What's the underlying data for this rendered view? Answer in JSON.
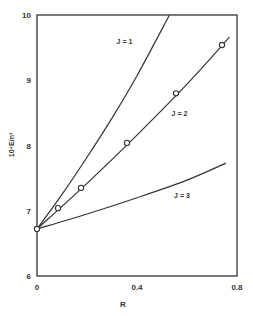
{
  "chart_data": {
    "type": "line",
    "title": "",
    "xlabel": "R",
    "ylabel": "10⁴E/n³",
    "xlim": [
      0,
      0.8
    ],
    "ylim": [
      6,
      10
    ],
    "xticks": [
      0,
      0.4,
      0.8
    ],
    "xtick_labels": [
      "0",
      "0.4",
      "0.8"
    ],
    "yticks": [
      6,
      7,
      8,
      9,
      10
    ],
    "ytick_labels": [
      "6",
      "7",
      "8",
      "9",
      "10"
    ],
    "grid": false,
    "legend": "inline labels",
    "series": [
      {
        "name": "J = 1",
        "style": "line",
        "x": [
          0,
          0.1,
          0.2,
          0.3,
          0.4,
          0.53
        ],
        "y": [
          6.72,
          7.25,
          7.82,
          8.42,
          9.07,
          10.0
        ]
      },
      {
        "name": "J = 2",
        "style": "line",
        "x": [
          0,
          0.2,
          0.4,
          0.6,
          0.77
        ],
        "y": [
          6.72,
          7.42,
          8.16,
          8.94,
          9.66
        ]
      },
      {
        "name": "J = 2 (data points)",
        "style": "markers-open-circle",
        "x": [
          0,
          0.084,
          0.176,
          0.36,
          0.556,
          0.74
        ],
        "y": [
          6.72,
          7.04,
          7.35,
          8.04,
          8.8,
          9.54
        ]
      },
      {
        "name": "J = 3",
        "style": "line",
        "x": [
          0,
          0.2,
          0.4,
          0.6,
          0.756
        ],
        "y": [
          6.72,
          6.95,
          7.2,
          7.47,
          7.73
        ]
      }
    ],
    "annotations": [
      {
        "text": "J = 1",
        "x": 0.35,
        "y": 9.55
      },
      {
        "text": "J = 2",
        "x": 0.57,
        "y": 8.45
      },
      {
        "text": "J = 3",
        "x": 0.58,
        "y": 7.2
      }
    ]
  },
  "labels": {
    "x_axis": "R",
    "y_axis": "10⁴E/n³",
    "j1": "J = 1",
    "j2": "J = 2",
    "j3": "J = 3"
  }
}
